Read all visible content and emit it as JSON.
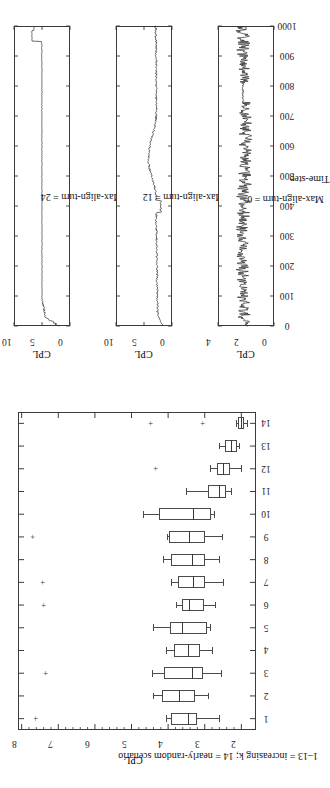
{
  "figure": {
    "orientation": "rotated-90-ccw",
    "background": "#ffffff",
    "ink": "#2b2b2b"
  },
  "chart_data": [
    {
      "id": "boxplot-cpl-by-scenario",
      "type": "box",
      "title": "",
      "xlabel": "1–13 = increasing k; 14 = nearly-random scenario",
      "ylabel": "CPL",
      "xticklabels": [
        "1",
        "2",
        "3",
        "4",
        "5",
        "6",
        "7",
        "8",
        "9",
        "10",
        "11",
        "12",
        "13",
        "14"
      ],
      "yticklabels": [
        "2",
        "3",
        "4",
        "5",
        "6",
        "7",
        "8"
      ],
      "ylim": [
        1.6,
        8.1
      ],
      "grid": false,
      "legend": "none",
      "boxes": [
        {
          "category": "1",
          "whisker_low": 2.62,
          "q1": 3.22,
          "median": 3.47,
          "q3": 3.93,
          "whisker_high": 4.06,
          "outliers": [
            7.62
          ]
        },
        {
          "category": "2",
          "whisker_low": 2.92,
          "q1": 3.26,
          "median": 3.7,
          "q3": 4.18,
          "whisker_high": 4.4,
          "outliers": []
        },
        {
          "category": "3",
          "whisker_low": 2.55,
          "q1": 3.05,
          "median": 3.34,
          "q3": 4.1,
          "whisker_high": 4.44,
          "outliers": [
            7.33
          ]
        },
        {
          "category": "4",
          "whisker_low": 2.8,
          "q1": 3.14,
          "median": 3.46,
          "q3": 3.84,
          "whisker_high": 4.06,
          "outliers": []
        },
        {
          "category": "5",
          "whisker_low": 2.86,
          "q1": 2.95,
          "median": 3.62,
          "q3": 3.96,
          "whisker_high": 4.42,
          "outliers": []
        },
        {
          "category": "6",
          "whisker_low": 2.73,
          "q1": 3.02,
          "median": 3.42,
          "q3": 3.62,
          "whisker_high": 3.78,
          "outliers": [
            7.38
          ]
        },
        {
          "category": "7",
          "whisker_low": 2.5,
          "q1": 3.0,
          "median": 3.32,
          "q3": 3.72,
          "whisker_high": 3.93,
          "outliers": [
            7.42
          ]
        },
        {
          "category": "8",
          "whisker_low": 2.6,
          "q1": 2.98,
          "median": 3.34,
          "q3": 3.92,
          "whisker_high": 4.14,
          "outliers": []
        },
        {
          "category": "9",
          "whisker_low": 2.52,
          "q1": 3.0,
          "median": 3.44,
          "q3": 3.98,
          "whisker_high": 4.02,
          "outliers": [
            7.7
          ]
        },
        {
          "category": "10",
          "whisker_low": 2.74,
          "q1": 2.84,
          "median": 3.32,
          "q3": 4.26,
          "whisker_high": 4.68,
          "outliers": []
        },
        {
          "category": "11",
          "whisker_low": 2.28,
          "q1": 2.42,
          "median": 2.6,
          "q3": 2.9,
          "whisker_high": 3.52,
          "outliers": []
        },
        {
          "category": "12",
          "whisker_low": 2.02,
          "q1": 2.3,
          "median": 2.5,
          "q3": 2.66,
          "whisker_high": 2.86,
          "outliers": [
            4.34
          ]
        },
        {
          "category": "13",
          "whisker_low": 2.06,
          "q1": 2.12,
          "median": 2.28,
          "q3": 2.44,
          "whisker_high": 2.62,
          "outliers": []
        },
        {
          "category": "14",
          "whisker_low": 1.84,
          "q1": 1.92,
          "median": 2.0,
          "q3": 2.1,
          "whisker_high": 2.14,
          "outliers": [
            3.06,
            4.46
          ]
        }
      ]
    },
    {
      "id": "timeseries-max-align-turn-24",
      "type": "line",
      "title": "Max-align-turn = 24",
      "xlabel": "",
      "ylabel": "CPL",
      "xticklabels": [
        "0",
        "100",
        "200",
        "300",
        "400",
        "500",
        "600",
        "700",
        "800",
        "900",
        "1000"
      ],
      "yticklabels": [
        "0",
        "5",
        "10"
      ],
      "xlim": [
        0,
        1000
      ],
      "ylim": [
        0,
        10
      ],
      "grid": false,
      "series": [
        {
          "name": "CPL",
          "comment": "starts ~2, rises quickly to ~5, flat to x=950, steps up to ~6.8 at the end"
        }
      ]
    },
    {
      "id": "timeseries-max-align-turn-12",
      "type": "line",
      "title": "Max-align-turn = 12",
      "xlabel": "",
      "ylabel": "CPL",
      "xticklabels": [
        "0",
        "100",
        "200",
        "300",
        "400",
        "500",
        "600",
        "700",
        "800",
        "900",
        "1000"
      ],
      "yticklabels": [
        "0",
        "5",
        "10"
      ],
      "xlim": [
        0,
        1000
      ],
      "ylim": [
        0,
        10
      ],
      "grid": false,
      "series": [
        {
          "name": "CPL",
          "comment": "noisy around 2-3, bump to ~4.5 near x=500-620, settles ~2.5-3"
        }
      ]
    },
    {
      "id": "timeseries-max-align-turn-0",
      "type": "line",
      "title": "Max-align-turn = 0",
      "xlabel": "Time-step",
      "ylabel": "CPL",
      "xticklabels": [
        "0",
        "100",
        "200",
        "300",
        "400",
        "500",
        "600",
        "700",
        "800",
        "900",
        "1000"
      ],
      "yticklabels": [
        "0",
        "2",
        "4"
      ],
      "xlim": [
        0,
        1000
      ],
      "ylim": [
        0,
        4
      ],
      "grid": false,
      "series": [
        {
          "name": "CPL",
          "comment": "high-frequency noise around 2.0-2.6 for the whole run"
        }
      ]
    }
  ],
  "labels": {
    "cpl": "CPL",
    "time_step": "Time-step",
    "scenario_axis": "1–13 = increasing k; 14 = nearly-random scenario",
    "panel_24": "Max-align-turn = 24",
    "panel_12": "Max-align-turn = 12",
    "panel_0": "Max-align-turn = 0",
    "box_yticks": [
      "2",
      "3",
      "4",
      "5",
      "6",
      "7",
      "8"
    ],
    "box_xticks": [
      "1",
      "2",
      "3",
      "4",
      "5",
      "6",
      "7",
      "8",
      "9",
      "10",
      "11",
      "12",
      "13",
      "14"
    ],
    "ts_xticks": [
      "0",
      "100",
      "200",
      "300",
      "400",
      "500",
      "600",
      "700",
      "800",
      "900",
      "1000"
    ],
    "ts_yticks_10": [
      "0",
      "5",
      "10"
    ],
    "ts_yticks_4": [
      "0",
      "2",
      "4"
    ]
  }
}
